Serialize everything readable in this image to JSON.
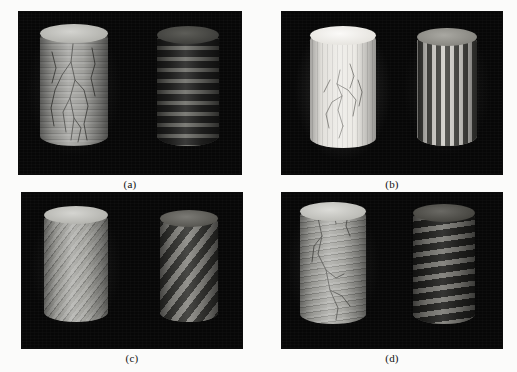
{
  "figure": {
    "background_color": "#fbfbfa",
    "panel_background_color": "#070707",
    "caption_color": "#111111",
    "panels": [
      {
        "id": "a",
        "label": "(a)",
        "rect": {
          "x": 19,
          "y": 12,
          "w": 222,
          "h": 162
        },
        "description": "Horizontal layered cylinders",
        "objects": [
          {
            "name": "left-cylinder",
            "role": "rendered-surface",
            "rect": {
              "x": 40,
              "y": 28,
              "w": 68,
              "h": 118
            },
            "base_color": "#9a9a96",
            "top_color": "#c9c9c4",
            "pattern": "horizontal-bands",
            "band_angle_deg": 0,
            "band_period_px": 6,
            "band_contrast": "low",
            "has_cracks": true
          },
          {
            "name": "right-cylinder",
            "role": "segmentation-map",
            "rect": {
              "x": 157,
              "y": 30,
              "w": 62,
              "h": 116
            },
            "base_color": "#3a3a38",
            "top_color": "#4a4a46",
            "pattern": "horizontal-bands",
            "band_angle_deg": 0,
            "band_period_px": 11,
            "band_contrast": "high",
            "has_cracks": false
          }
        ]
      },
      {
        "id": "b",
        "label": "(b)",
        "rect": {
          "x": 282,
          "y": 12,
          "w": 220,
          "h": 162
        },
        "description": "Vertical striped cylinders",
        "objects": [
          {
            "name": "left-cylinder",
            "role": "rendered-surface",
            "rect": {
              "x": 310,
              "y": 30,
              "w": 66,
              "h": 118
            },
            "base_color": "#ebe9e4",
            "top_color": "#f6f5f2",
            "pattern": "vertical-stripes",
            "band_angle_deg": 90,
            "band_period_px": 5,
            "band_contrast": "low",
            "has_cracks": true
          },
          {
            "name": "right-cylinder",
            "role": "segmentation-map",
            "rect": {
              "x": 417,
              "y": 32,
              "w": 60,
              "h": 114
            },
            "base_color": "#8e8d88",
            "top_color": "#9b9a94",
            "pattern": "vertical-stripes",
            "band_angle_deg": 90,
            "band_period_px": 9,
            "band_contrast": "high",
            "has_cracks": false
          }
        ]
      },
      {
        "id": "c",
        "label": "(c)",
        "rect": {
          "x": 22,
          "y": 193,
          "w": 220,
          "h": 155
        },
        "description": "Steep helical (diagonal) striped cylinders",
        "objects": [
          {
            "name": "left-cylinder",
            "role": "rendered-surface",
            "rect": {
              "x": 44,
              "y": 210,
              "w": 64,
              "h": 112
            },
            "base_color": "#9d9d98",
            "top_color": "#cacac5",
            "pattern": "diagonal-stripes",
            "band_angle_deg": 52,
            "band_period_px": 7,
            "band_contrast": "low",
            "has_cracks": false
          },
          {
            "name": "right-cylinder",
            "role": "segmentation-map",
            "rect": {
              "x": 160,
              "y": 214,
              "w": 58,
              "h": 108
            },
            "base_color": "#5a5a56",
            "top_color": "#65645f",
            "pattern": "diagonal-stripes",
            "band_angle_deg": 52,
            "band_period_px": 13,
            "band_contrast": "high",
            "has_cracks": false
          }
        ]
      },
      {
        "id": "d",
        "label": "(d)",
        "rect": {
          "x": 282,
          "y": 193,
          "w": 220,
          "h": 155
        },
        "description": "Shallow helical (spiral ring) cylinders",
        "objects": [
          {
            "name": "left-cylinder",
            "role": "rendered-surface",
            "rect": {
              "x": 300,
              "y": 206,
              "w": 66,
              "h": 118
            },
            "base_color": "#a3a39e",
            "top_color": "#cfcfca",
            "pattern": "shallow-helix",
            "band_angle_deg": 10,
            "band_period_px": 6,
            "band_contrast": "low",
            "has_cracks": true
          },
          {
            "name": "right-cylinder",
            "role": "segmentation-map",
            "rect": {
              "x": 413,
              "y": 208,
              "w": 62,
              "h": 116
            },
            "base_color": "#4c4c48",
            "top_color": "#585853",
            "pattern": "shallow-helix",
            "band_angle_deg": 10,
            "band_period_px": 12,
            "band_contrast": "high",
            "has_cracks": false
          }
        ]
      }
    ]
  }
}
